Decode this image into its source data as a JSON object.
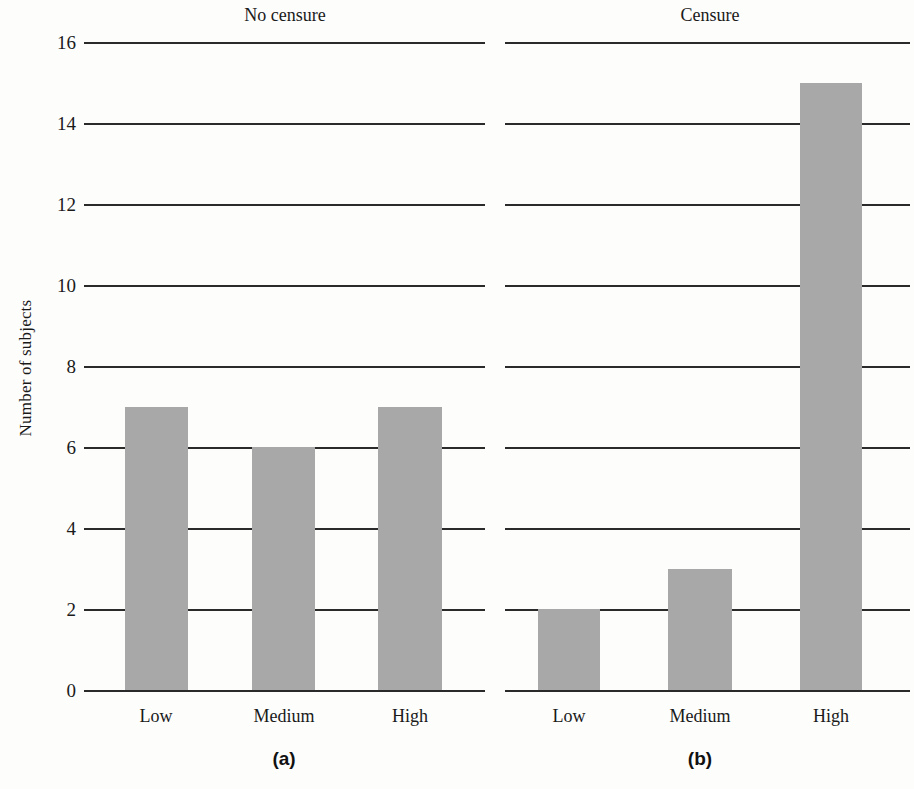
{
  "figure": {
    "y_axis_title": "Number of subjects",
    "panels": [
      {
        "id": "a",
        "title": "No censure",
        "caption": "(a)",
        "categories": [
          "Low",
          "Medium",
          "High"
        ],
        "values": [
          7,
          6,
          7
        ]
      },
      {
        "id": "b",
        "title": "Censure",
        "caption": "(b)",
        "categories": [
          "Low",
          "Medium",
          "High"
        ],
        "values": [
          2,
          3,
          15
        ]
      }
    ],
    "y_ticks": [
      "16",
      "14",
      "12",
      "10",
      "8",
      "6",
      "4",
      "2",
      "0"
    ],
    "colors": {
      "bar_fill": "#a8a8a8",
      "axis_line": "#2a2a2a",
      "background": "#fdfdfc",
      "text": "#1a1a1a"
    }
  },
  "chart_data": {
    "type": "bar",
    "title": "",
    "subtitle": "",
    "xlabel": "",
    "ylabel": "Number of subjects",
    "ylim": [
      0,
      16
    ],
    "ytick_values": [
      0,
      2,
      4,
      6,
      8,
      10,
      12,
      14,
      16
    ],
    "grid": "horizontal-only",
    "legend": "none",
    "panels": [
      {
        "panel_label": "(a)",
        "panel_title": "No censure",
        "categories": [
          "Low",
          "Medium",
          "High"
        ],
        "series": [
          {
            "name": "Number of subjects",
            "values": [
              7,
              6,
              7
            ]
          }
        ]
      },
      {
        "panel_label": "(b)",
        "panel_title": "Censure",
        "categories": [
          "Low",
          "Medium",
          "High"
        ],
        "series": [
          {
            "name": "Number of subjects",
            "values": [
              2,
              3,
              15
            ]
          }
        ]
      }
    ]
  }
}
